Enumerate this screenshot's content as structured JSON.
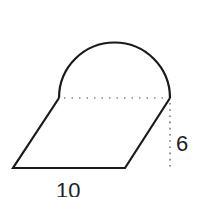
{
  "diagram": {
    "shapes": {
      "parallelogram": {
        "points": [
          [
            13,
            168
          ],
          [
            125,
            168
          ],
          [
            170,
            98
          ],
          [
            59,
            98
          ]
        ]
      },
      "semicircle": {
        "start": [
          59,
          98
        ],
        "end": [
          170,
          98
        ],
        "radius": 55.5
      },
      "diameter_dotted": {
        "from": [
          62,
          98
        ],
        "to": [
          168,
          98
        ]
      },
      "height_dotted": {
        "from": [
          170,
          101
        ],
        "to": [
          170,
          168
        ]
      }
    },
    "labels": {
      "base": "10",
      "height": "6"
    },
    "colors": {
      "stroke": "#1a1a1a",
      "dotted": "#777777",
      "text": "#222222"
    }
  }
}
